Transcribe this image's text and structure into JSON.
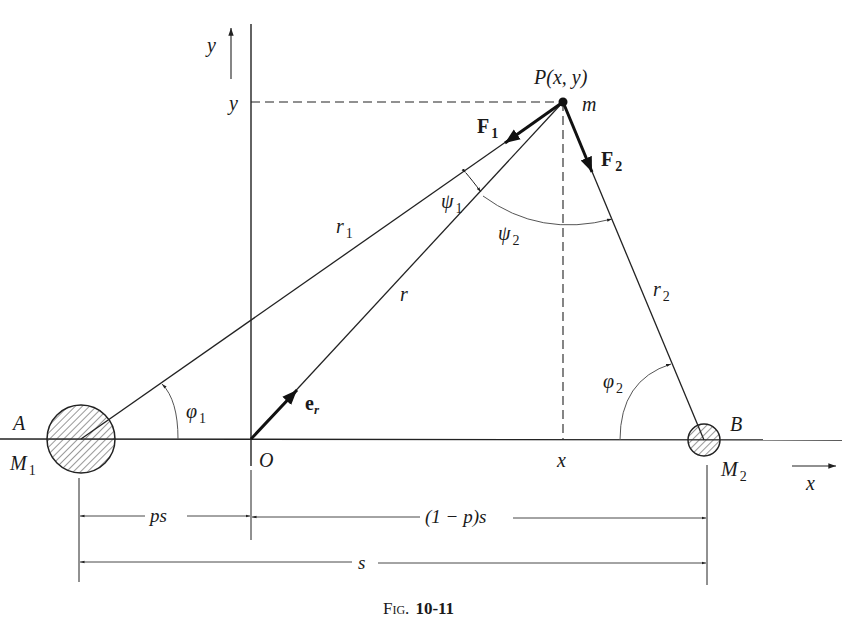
{
  "figure": {
    "caption_prefix": "Fig.",
    "caption_number": "10-11"
  },
  "axes": {
    "y_axis_label": "y",
    "y_level_label": "y",
    "x_axis_label": "x",
    "x_foot_label": "x",
    "origin_label": "O"
  },
  "point_p": {
    "label": "P(x, y)",
    "mass_label": "m"
  },
  "body_a": {
    "point_label": "A",
    "mass_main": "M",
    "mass_sub": "1"
  },
  "body_b": {
    "point_label": "B",
    "mass_main": "M",
    "mass_sub": "2"
  },
  "vectors": {
    "f1_main": "F",
    "f1_sub": "1",
    "f2_main": "F",
    "f2_sub": "2",
    "er_main": "e",
    "er_sub": "r"
  },
  "lengths": {
    "r1_main": "r",
    "r1_sub": "1",
    "r2_main": "r",
    "r2_sub": "2",
    "r": "r"
  },
  "angles": {
    "psi1_main": "ψ",
    "psi1_sub": "1",
    "psi2_main": "ψ",
    "psi2_sub": "2",
    "phi1_main": "φ",
    "phi1_sub": "1",
    "phi2_main": "φ",
    "phi2_sub": "2"
  },
  "dimensions": {
    "ps": "ps",
    "one_minus_p_s": "(1 − p)s",
    "s": "s"
  }
}
